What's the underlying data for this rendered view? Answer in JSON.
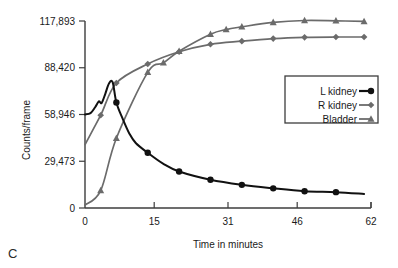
{
  "panel": {
    "label": "C"
  },
  "chart_data": {
    "type": "line",
    "title": "",
    "xlabel": "Time in minutes",
    "ylabel": "Counts/frame",
    "xlim": [
      0,
      62
    ],
    "ylim": [
      0,
      117893
    ],
    "xticks": [
      0,
      15,
      31,
      46,
      62
    ],
    "xtick_labels": [
      "0",
      "15",
      "31",
      "46",
      "62"
    ],
    "yticks": [
      0,
      29473,
      58946,
      88420,
      117893
    ],
    "ytick_labels": [
      "0",
      "29,473",
      "58,946",
      "88,420",
      "117,893"
    ],
    "grid": false,
    "legend_position": "center-right",
    "series": [
      {
        "name": "L kidney",
        "color": "#111111",
        "marker": "circle",
        "x": [
          0,
          1.2,
          2.2,
          3.0,
          3.6,
          4.4,
          5.2,
          6.0,
          6.8,
          8.2,
          9.6,
          11.0,
          13.6,
          17.0,
          20.4,
          27.2,
          34.0,
          40.8,
          47.6,
          54.4,
          60.5
        ],
        "values": [
          58946,
          59800,
          63500,
          67200,
          66200,
          72000,
          78500,
          79200,
          66500,
          56000,
          47000,
          41000,
          34800,
          27800,
          23000,
          17800,
          14600,
          12400,
          10600,
          10000,
          8900
        ]
      },
      {
        "name": "R kidney",
        "color": "#6b6b6b",
        "marker": "diamond",
        "x": [
          0,
          3.4,
          6.8,
          13.6,
          20.4,
          27.2,
          34.0,
          40.8,
          47.6,
          54.4,
          60.5
        ],
        "values": [
          40000,
          58500,
          78800,
          90800,
          98500,
          103200,
          105200,
          106800,
          107600,
          107800,
          107800
        ]
      },
      {
        "name": "Bladder",
        "color": "#6b6b6b",
        "marker": "triangle",
        "x": [
          0,
          3.4,
          6.8,
          13.6,
          17.0,
          20.4,
          27.2,
          30.6,
          34.0,
          40.8,
          47.6,
          54.4,
          60.5
        ],
        "values": [
          1800,
          11000,
          44000,
          85500,
          91500,
          98800,
          109500,
          112500,
          114200,
          117000,
          118200,
          118000,
          117600
        ]
      }
    ]
  }
}
